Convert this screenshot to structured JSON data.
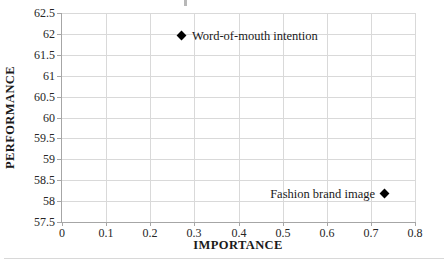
{
  "chart_data": {
    "type": "scatter",
    "title": "",
    "xlabel": "IMPORTANCE",
    "ylabel": "PERFORMANCE",
    "xlim": [
      0,
      0.8
    ],
    "xtick_step": 0.1,
    "ylim": [
      57.5,
      62.5
    ],
    "ytick_step": 0.5,
    "grid": true,
    "legend": false,
    "marker_style": "diamond",
    "xticklabels": [
      "0",
      "0.1",
      "0.2",
      "0.3",
      "0.4",
      "0.5",
      "0.6",
      "0.7",
      "0.8"
    ],
    "yticklabels": [
      "57.5",
      "58",
      "58.5",
      "59",
      "59.5",
      "60",
      "60.5",
      "61",
      "61.5",
      "62",
      "62.5"
    ],
    "points": [
      {
        "label": "Word-of-mouth intention",
        "x": 0.27,
        "y": 61.95,
        "label_side": "right"
      },
      {
        "label": "Fashion brand image",
        "x": 0.73,
        "y": 58.17,
        "label_side": "left"
      }
    ],
    "colors": {
      "grid": "#d9d9d9",
      "axis": "#a6a6a6",
      "marker": "#000000",
      "text": "#1a1a1a"
    }
  }
}
